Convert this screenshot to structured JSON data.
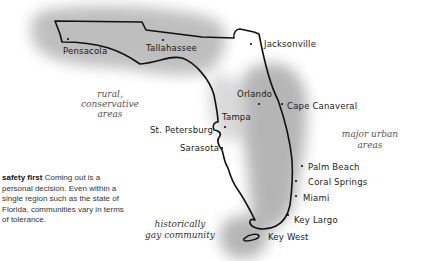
{
  "caption": {
    "lead": "safety first",
    "body": " Coming out is a personal decision. Even within a single region such as the state of Florida, communities vary in terms of tolerance."
  },
  "regions": {
    "rural": {
      "line1": "rural,",
      "line2": "conservative",
      "line3": "areas"
    },
    "urban": {
      "line1": "major urban",
      "line2": "areas"
    },
    "historic": {
      "line1": "historically",
      "line2": "gay community"
    }
  },
  "cities": [
    {
      "name": "Pensacola"
    },
    {
      "name": "Tallahassee"
    },
    {
      "name": "Jacksonville"
    },
    {
      "name": "Orlando"
    },
    {
      "name": "Cape Canaveral"
    },
    {
      "name": "Tampa"
    },
    {
      "name": "St. Petersburg"
    },
    {
      "name": "Sarasota"
    },
    {
      "name": "Palm Beach"
    },
    {
      "name": "Coral Springs"
    },
    {
      "name": "Miami"
    },
    {
      "name": "Key Largo"
    },
    {
      "name": "Key West"
    }
  ],
  "colors": {
    "shade": "#9a9a9a",
    "outline": "#111111"
  }
}
